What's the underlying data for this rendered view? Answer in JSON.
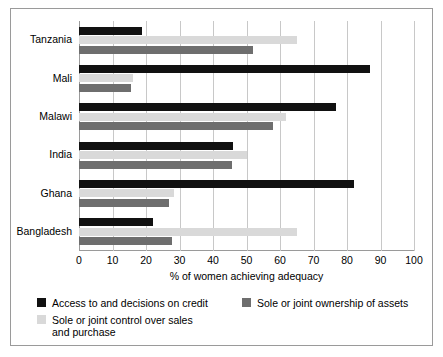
{
  "chart_data": {
    "type": "bar",
    "orientation": "horizontal",
    "title": "",
    "xlabel": "% of women achieving adequacy",
    "ylabel": "",
    "xlim": [
      0,
      100
    ],
    "xticks": [
      0,
      10,
      20,
      30,
      40,
      50,
      60,
      70,
      80,
      90,
      100
    ],
    "xtick_labels": [
      "0",
      "10",
      "20",
      "30",
      "40",
      "50",
      "60",
      "70",
      "80",
      "90",
      "100"
    ],
    "grid": true,
    "legend_position": "bottom",
    "categories": [
      "Tanzania",
      "Mali",
      "Malawi",
      "India",
      "Ghana",
      "Bangladesh"
    ],
    "series": [
      {
        "name": "Access to and decisions on credit",
        "color": "#111111",
        "values": [
          18.8,
          87.0,
          76.7,
          46.0,
          82.0,
          22.0
        ]
      },
      {
        "name": "Sole or joint control over sales and purchase",
        "color": "#d9d9d9",
        "values": [
          65.0,
          16.0,
          61.7,
          50.0,
          28.5,
          65.0
        ]
      },
      {
        "name": "Sole or joint ownership of assets",
        "color": "#6e6e6e",
        "values": [
          52.0,
          15.5,
          57.8,
          45.6,
          27.0,
          27.7
        ]
      }
    ]
  },
  "legend": {
    "items": [
      {
        "label": "Access to and decisions on credit",
        "color": "#111111"
      },
      {
        "label": "Sole or joint ownership of assets",
        "color": "#6e6e6e"
      },
      {
        "label": "Sole or joint control over sales\nand purchase",
        "color": "#d9d9d9"
      }
    ]
  },
  "colors": {
    "credit": "#111111",
    "ownership": "#6e6e6e",
    "control": "#d9d9d9",
    "gridline": "#c8c8c8",
    "axis": "#9a9a9a",
    "border": "#9a9a9a",
    "background": "#ffffff"
  }
}
